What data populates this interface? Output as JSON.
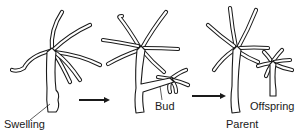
{
  "figure": {
    "stages": [
      {
        "id": "stage-1",
        "label": "Swelling"
      },
      {
        "id": "stage-2",
        "label": "Bud"
      },
      {
        "id": "stage-3",
        "labels": [
          "Parent",
          "Offspring"
        ]
      }
    ],
    "arrows": 2,
    "colors": {
      "ink": "#1a1a1a",
      "background": "#ffffff"
    }
  },
  "labels": {
    "swelling": "Swelling",
    "bud": "Bud",
    "parent": "Parent",
    "offspring": "Offspring"
  }
}
